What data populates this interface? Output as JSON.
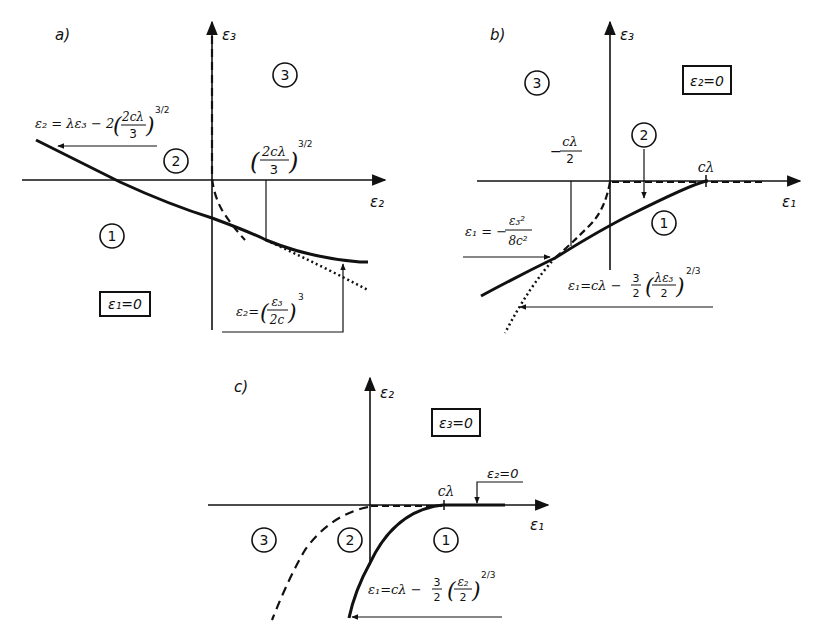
{
  "panels": {
    "a": {
      "label": "a)",
      "x_axis": "ε₂",
      "y_axis": "ε₃",
      "condition": "ε₁=0",
      "regions": [
        "1",
        "2",
        "3"
      ],
      "formula_line": "ε₂ = λε₃ − 2",
      "formula_line_frac_num": "2cλ",
      "formula_line_frac_den": "3",
      "formula_line_exp": "3/2",
      "tick_frac_num": "2cλ",
      "tick_frac_den": "3",
      "tick_exp": "3/2",
      "formula_cubic_lhs": "ε₂=",
      "formula_cubic_num": "ε₃",
      "formula_cubic_den": "2c",
      "formula_cubic_exp": "3"
    },
    "b": {
      "label": "b)",
      "x_axis": "ε₁",
      "y_axis": "ε₃",
      "condition": "ε₂=0",
      "regions": [
        "1",
        "2",
        "3"
      ],
      "tick_right": "cλ",
      "tick_left_sign": "−",
      "tick_left_num": "cλ",
      "tick_left_den": "2",
      "formula_parab_lhs": "ε₁ = −",
      "formula_parab_num": "ε₃²",
      "formula_parab_den": "8c²",
      "formula_curve_lhs": "ε₁=cλ −",
      "formula_curve_c_num": "3",
      "formula_curve_c_den": "2",
      "formula_curve_num": "λε₃",
      "formula_curve_den": "2",
      "formula_curve_exp": "2/3"
    },
    "c": {
      "label": "c)",
      "x_axis": "ε₁",
      "y_axis": "ε₂",
      "condition": "ε₃=0",
      "regions": [
        "3",
        "2",
        "1"
      ],
      "tick_right": "cλ",
      "annot_zero": "ε₂=0",
      "formula_curve_lhs": "ε₁=cλ −",
      "formula_curve_c_num": "3",
      "formula_curve_c_den": "2",
      "formula_curve_num": "ε₂",
      "formula_curve_den": "2",
      "formula_curve_exp": "2/3"
    }
  }
}
